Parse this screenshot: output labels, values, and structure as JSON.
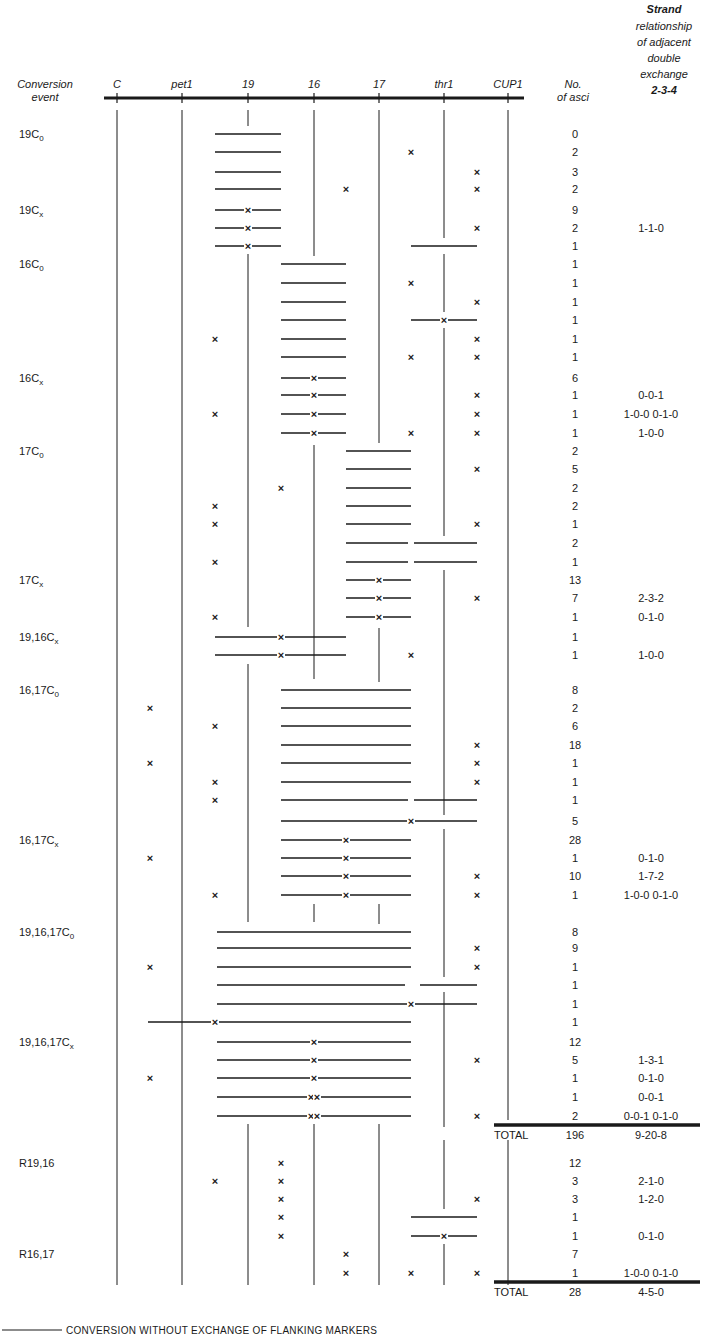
{
  "figure": {
    "header": {
      "conversion_event": [
        "Conversion",
        "event"
      ],
      "markers": [
        {
          "name": "C",
          "x": 117
        },
        {
          "name": "pet1",
          "x": 182
        },
        {
          "name": "19",
          "x": 248
        },
        {
          "name": "16",
          "x": 314
        },
        {
          "name": "17",
          "x": 379
        },
        {
          "name": "thr1",
          "x": 444
        },
        {
          "name": "CUP1",
          "x": 508
        }
      ],
      "no_of_asci": [
        "No.",
        "of asci"
      ],
      "strand_relationship": [
        "Strand",
        "relationship",
        "of adjacent",
        "double",
        "exchange",
        "2-3-4"
      ]
    },
    "groups": [
      {
        "label": "19C",
        "sub": "0",
        "row": 0
      },
      {
        "label": "19C",
        "sub": "x",
        "row": 4
      },
      {
        "label": "16C",
        "sub": "0",
        "row": 7
      },
      {
        "label": "16C",
        "sub": "x",
        "row": 13
      },
      {
        "label": "17C",
        "sub": "0",
        "row": 17
      },
      {
        "label": "17C",
        "sub": "x",
        "row": 24
      },
      {
        "label": "19,16C",
        "sub": "x",
        "row": 27
      },
      {
        "label": "16,17C",
        "sub": "0",
        "row": 29
      },
      {
        "label": "16,17C",
        "sub": "x",
        "row": 37
      },
      {
        "label": "19,16,17C",
        "sub": "0",
        "row": 41
      },
      {
        "label": "19,16,17C",
        "sub": "x",
        "row": 47
      },
      {
        "label": "R19,16",
        "sub": "",
        "row": 52
      },
      {
        "label": "R16,17",
        "sub": "",
        "row": 57
      }
    ],
    "rows": [
      {
        "y": 134,
        "segs": [
          [
            215,
            281
          ]
        ],
        "xs": [],
        "segx": [],
        "n": "0",
        "rel": ""
      },
      {
        "y": 152,
        "segs": [
          [
            215,
            281
          ]
        ],
        "xs": [
          411
        ],
        "segx": [],
        "n": "2",
        "rel": ""
      },
      {
        "y": 172,
        "segs": [
          [
            215,
            281
          ]
        ],
        "xs": [
          477
        ],
        "segx": [],
        "n": "3",
        "rel": ""
      },
      {
        "y": 189,
        "segs": [
          [
            215,
            281
          ]
        ],
        "xs": [
          346,
          477
        ],
        "segx": [],
        "n": "2",
        "rel": ""
      },
      {
        "y": 210,
        "segs": [
          [
            215,
            281
          ]
        ],
        "xs": [],
        "segx": [
          248
        ],
        "n": "9",
        "rel": ""
      },
      {
        "y": 228,
        "segs": [
          [
            215,
            281
          ]
        ],
        "xs": [
          477
        ],
        "segx": [
          248
        ],
        "n": "2",
        "rel": "1-1-0"
      },
      {
        "y": 246,
        "segs": [
          [
            215,
            281
          ],
          [
            411,
            477
          ]
        ],
        "xs": [],
        "segx": [
          248
        ],
        "n": "1",
        "rel": ""
      },
      {
        "y": 264,
        "segs": [
          [
            281,
            346
          ]
        ],
        "xs": [],
        "segx": [],
        "n": "1",
        "rel": ""
      },
      {
        "y": 283,
        "segs": [
          [
            281,
            346
          ]
        ],
        "xs": [
          411
        ],
        "segx": [],
        "n": "1",
        "rel": ""
      },
      {
        "y": 302,
        "segs": [
          [
            281,
            346
          ]
        ],
        "xs": [
          477
        ],
        "segx": [],
        "n": "1",
        "rel": ""
      },
      {
        "y": 320,
        "segs": [
          [
            281,
            346
          ],
          [
            411,
            477
          ]
        ],
        "xs": [],
        "segx": [
          444
        ],
        "n": "1",
        "rel": ""
      },
      {
        "y": 339,
        "segs": [
          [
            281,
            346
          ]
        ],
        "xs": [
          215,
          477
        ],
        "segx": [],
        "n": "1",
        "rel": ""
      },
      {
        "y": 357,
        "segs": [
          [
            281,
            346
          ]
        ],
        "xs": [
          411,
          477
        ],
        "segx": [],
        "n": "1",
        "rel": ""
      },
      {
        "y": 378,
        "segs": [
          [
            281,
            346
          ]
        ],
        "xs": [],
        "segx": [
          314
        ],
        "n": "6",
        "rel": ""
      },
      {
        "y": 395,
        "segs": [
          [
            281,
            346
          ]
        ],
        "xs": [
          477
        ],
        "segx": [
          314
        ],
        "n": "1",
        "rel": "0-0-1"
      },
      {
        "y": 414,
        "segs": [
          [
            281,
            346
          ]
        ],
        "xs": [
          215,
          477
        ],
        "segx": [
          314
        ],
        "n": "1",
        "rel": "1-0-0  0-1-0"
      },
      {
        "y": 433,
        "segs": [
          [
            281,
            346
          ]
        ],
        "xs": [
          411,
          477
        ],
        "segx": [
          314
        ],
        "n": "1",
        "rel": "1-0-0"
      },
      {
        "y": 451,
        "segs": [
          [
            346,
            411
          ]
        ],
        "xs": [],
        "segx": [],
        "n": "2",
        "rel": ""
      },
      {
        "y": 469,
        "segs": [
          [
            346,
            411
          ]
        ],
        "xs": [
          477
        ],
        "segx": [],
        "n": "5",
        "rel": ""
      },
      {
        "y": 488,
        "segs": [
          [
            346,
            411
          ]
        ],
        "xs": [
          281
        ],
        "segx": [],
        "n": "2",
        "rel": ""
      },
      {
        "y": 506,
        "segs": [
          [
            346,
            411
          ]
        ],
        "xs": [
          215
        ],
        "segx": [],
        "n": "2",
        "rel": ""
      },
      {
        "y": 524,
        "segs": [
          [
            346,
            411
          ]
        ],
        "xs": [
          215,
          477
        ],
        "segx": [],
        "n": "1",
        "rel": ""
      },
      {
        "y": 543,
        "segs": [
          [
            346,
            408
          ],
          [
            414,
            477
          ]
        ],
        "xs": [],
        "segx": [],
        "n": "2",
        "rel": ""
      },
      {
        "y": 562,
        "segs": [
          [
            346,
            408
          ],
          [
            414,
            477
          ]
        ],
        "xs": [
          215
        ],
        "segx": [],
        "n": "1",
        "rel": ""
      },
      {
        "y": 580,
        "segs": [
          [
            346,
            411
          ]
        ],
        "xs": [],
        "segx": [
          379
        ],
        "n": "13",
        "rel": ""
      },
      {
        "y": 598,
        "segs": [
          [
            346,
            411
          ]
        ],
        "xs": [
          477
        ],
        "segx": [
          379
        ],
        "n": "7",
        "rel": "2-3-2"
      },
      {
        "y": 617,
        "segs": [
          [
            346,
            411
          ]
        ],
        "xs": [
          215
        ],
        "segx": [
          379
        ],
        "n": "1",
        "rel": "0-1-0"
      },
      {
        "y": 637,
        "segs": [
          [
            215,
            346
          ]
        ],
        "xs": [],
        "segx": [
          281
        ],
        "n": "1",
        "rel": ""
      },
      {
        "y": 655,
        "segs": [
          [
            215,
            346
          ]
        ],
        "xs": [
          411
        ],
        "segx": [
          281
        ],
        "n": "1",
        "rel": "1-0-0"
      },
      {
        "y": 690,
        "segs": [
          [
            281,
            411
          ]
        ],
        "xs": [],
        "segx": [],
        "n": "8",
        "rel": ""
      },
      {
        "y": 708,
        "segs": [
          [
            281,
            411
          ]
        ],
        "xs": [
          150
        ],
        "segx": [],
        "n": "2",
        "rel": ""
      },
      {
        "y": 726,
        "segs": [
          [
            281,
            411
          ]
        ],
        "xs": [
          215
        ],
        "segx": [],
        "n": "6",
        "rel": ""
      },
      {
        "y": 745,
        "segs": [
          [
            281,
            411
          ]
        ],
        "xs": [
          477
        ],
        "segx": [],
        "n": "18",
        "rel": ""
      },
      {
        "y": 763,
        "segs": [
          [
            281,
            411
          ]
        ],
        "xs": [
          150,
          477
        ],
        "segx": [],
        "n": "1",
        "rel": ""
      },
      {
        "y": 782,
        "segs": [
          [
            281,
            411
          ]
        ],
        "xs": [
          215,
          477
        ],
        "segx": [],
        "n": "1",
        "rel": ""
      },
      {
        "y": 800,
        "segs": [
          [
            281,
            408
          ],
          [
            414,
            477
          ]
        ],
        "xs": [
          215
        ],
        "segx": [],
        "n": "1",
        "rel": ""
      },
      {
        "y": 821,
        "segs": [
          [
            281,
            477
          ]
        ],
        "xs": [],
        "segx": [
          411
        ],
        "n": "5",
        "rel": ""
      },
      {
        "y": 840,
        "segs": [
          [
            281,
            411
          ]
        ],
        "xs": [],
        "segx": [
          346
        ],
        "n": "28",
        "rel": ""
      },
      {
        "y": 858,
        "segs": [
          [
            281,
            411
          ]
        ],
        "xs": [
          150
        ],
        "segx": [
          346
        ],
        "n": "1",
        "rel": "0-1-0"
      },
      {
        "y": 876,
        "segs": [
          [
            281,
            411
          ]
        ],
        "xs": [
          477
        ],
        "segx": [
          346
        ],
        "n": "10",
        "rel": "1-7-2"
      },
      {
        "y": 895,
        "segs": [
          [
            281,
            411
          ]
        ],
        "xs": [
          215,
          477
        ],
        "segx": [
          346
        ],
        "n": "1",
        "rel": "1-0-0  0-1-0"
      },
      {
        "y": 932,
        "segs": [
          [
            217,
            411
          ]
        ],
        "xs": [],
        "segx": [],
        "n": "8",
        "rel": ""
      },
      {
        "y": 948,
        "segs": [
          [
            217,
            411
          ]
        ],
        "xs": [
          477
        ],
        "segx": [],
        "n": "9",
        "rel": ""
      },
      {
        "y": 967,
        "segs": [
          [
            217,
            411
          ]
        ],
        "xs": [
          150,
          477
        ],
        "segx": [],
        "n": "1",
        "rel": ""
      },
      {
        "y": 985,
        "segs": [
          [
            217,
            405
          ],
          [
            420,
            477
          ]
        ],
        "xs": [],
        "segx": [],
        "n": "1",
        "rel": ""
      },
      {
        "y": 1004,
        "segs": [
          [
            217,
            477
          ]
        ],
        "xs": [],
        "segx": [
          411
        ],
        "n": "1",
        "rel": ""
      },
      {
        "y": 1022,
        "segs": [
          [
            148,
            411
          ]
        ],
        "xs": [],
        "segx": [
          215
        ],
        "n": "1",
        "rel": ""
      },
      {
        "y": 1042,
        "segs": [
          [
            217,
            411
          ]
        ],
        "xs": [],
        "segx": [
          314
        ],
        "n": "12",
        "rel": ""
      },
      {
        "y": 1060,
        "segs": [
          [
            217,
            411
          ]
        ],
        "xs": [
          477
        ],
        "segx": [
          314
        ],
        "n": "5",
        "rel": "1-3-1"
      },
      {
        "y": 1078,
        "segs": [
          [
            217,
            411
          ]
        ],
        "xs": [
          150
        ],
        "segx": [
          314
        ],
        "n": "1",
        "rel": "0-1-0"
      },
      {
        "y": 1097,
        "segs": [
          [
            217,
            411
          ]
        ],
        "xs": [],
        "segx": [
          311,
          317
        ],
        "n": "1",
        "rel": "0-0-1"
      },
      {
        "y": 1116,
        "segs": [
          [
            217,
            411
          ]
        ],
        "xs": [
          477
        ],
        "segx": [
          311,
          317
        ],
        "n": "2",
        "rel": "0-0-1  0-1-0"
      },
      {
        "y": 1163,
        "segs": [],
        "xs": [
          281
        ],
        "segx": [],
        "n": "12",
        "rel": ""
      },
      {
        "y": 1181,
        "segs": [],
        "xs": [
          215,
          281
        ],
        "segx": [],
        "n": "3",
        "rel": "2-1-0"
      },
      {
        "y": 1199,
        "segs": [],
        "xs": [
          281,
          477
        ],
        "segx": [],
        "n": "3",
        "rel": "1-2-0"
      },
      {
        "y": 1217,
        "segs": [
          [
            411,
            477
          ]
        ],
        "xs": [
          281
        ],
        "segx": [],
        "n": "1",
        "rel": ""
      },
      {
        "y": 1236,
        "segs": [
          [
            411,
            477
          ]
        ],
        "xs": [
          281
        ],
        "segx": [
          444
        ],
        "n": "1",
        "rel": "0-1-0"
      },
      {
        "y": 1254,
        "segs": [],
        "xs": [
          346
        ],
        "segx": [],
        "n": "7",
        "rel": ""
      },
      {
        "y": 1273,
        "segs": [],
        "xs": [
          346,
          411,
          477
        ],
        "segx": [],
        "n": "1",
        "rel": "1-0-0  0-1-0"
      }
    ],
    "totals": [
      {
        "y": 1135,
        "label": "TOTAL",
        "n": "196",
        "rel": "9-20-8",
        "rule_y": 1125
      },
      {
        "y": 1292,
        "label": "TOTAL",
        "n": "28",
        "rel": "4-5-0",
        "rule_y": 1282
      }
    ],
    "legend": {
      "text": "CONVERSION WITHOUT EXCHANGE OF FLANKING MARKERS"
    }
  },
  "chart_data": {
    "type": "table",
    "markers": [
      "C",
      "pet1",
      "19",
      "16",
      "17",
      "thr1",
      "CUP1"
    ],
    "columns": [
      "Conversion event",
      "No. of asci",
      "Strand relationship of adjacent double exchange 2-3-4"
    ],
    "groups": [
      {
        "event": "19C0",
        "asci": [
          0,
          2,
          3,
          2
        ],
        "rel": [
          "",
          "",
          "",
          ""
        ]
      },
      {
        "event": "19Cx",
        "asci": [
          9,
          2,
          1
        ],
        "rel": [
          "",
          "1-1-0",
          ""
        ]
      },
      {
        "event": "16C0",
        "asci": [
          1,
          1,
          1,
          1,
          1,
          1
        ],
        "rel": [
          "",
          "",
          "",
          "",
          "",
          ""
        ]
      },
      {
        "event": "16Cx",
        "asci": [
          6,
          1,
          1,
          1
        ],
        "rel": [
          "",
          "0-0-1",
          "1-0-0 0-1-0",
          "1-0-0"
        ]
      },
      {
        "event": "17C0",
        "asci": [
          2,
          5,
          2,
          2,
          1,
          2,
          1
        ],
        "rel": [
          "",
          "",
          "",
          "",
          "",
          "",
          ""
        ]
      },
      {
        "event": "17Cx",
        "asci": [
          13,
          7,
          1
        ],
        "rel": [
          "",
          "2-3-2",
          "0-1-0"
        ]
      },
      {
        "event": "19,16Cx",
        "asci": [
          1,
          1
        ],
        "rel": [
          "",
          "1-0-0"
        ]
      },
      {
        "event": "16,17C0",
        "asci": [
          8,
          2,
          6,
          18,
          1,
          1,
          1,
          5
        ],
        "rel": [
          "",
          "",
          "",
          "",
          "",
          "",
          "",
          ""
        ]
      },
      {
        "event": "16,17Cx",
        "asci": [
          28,
          1,
          10,
          1
        ],
        "rel": [
          "",
          "0-1-0",
          "1-7-2",
          "1-0-0 0-1-0"
        ]
      },
      {
        "event": "19,16,17C0",
        "asci": [
          8,
          9,
          1,
          1,
          1,
          1
        ],
        "rel": [
          "",
          "",
          "",
          "",
          "",
          ""
        ]
      },
      {
        "event": "19,16,17Cx",
        "asci": [
          12,
          5,
          1,
          1,
          2
        ],
        "rel": [
          "",
          "1-3-1",
          "0-1-0",
          "0-0-1",
          "0-0-1 0-1-0"
        ]
      },
      {
        "event": "TOTAL",
        "asci": [
          196
        ],
        "rel": [
          "9-20-8"
        ]
      },
      {
        "event": "R19,16",
        "asci": [
          12,
          3,
          3,
          1,
          1
        ],
        "rel": [
          "",
          "2-1-0",
          "1-2-0",
          "",
          "0-1-0"
        ]
      },
      {
        "event": "R16,17",
        "asci": [
          7,
          1
        ],
        "rel": [
          "",
          "1-0-0 0-1-0"
        ]
      },
      {
        "event": "TOTAL",
        "asci": [
          28
        ],
        "rel": [
          "4-5-0"
        ]
      }
    ],
    "legend": [
      "CONVERSION WITHOUT EXCHANGE OF FLANKING MARKERS"
    ]
  }
}
